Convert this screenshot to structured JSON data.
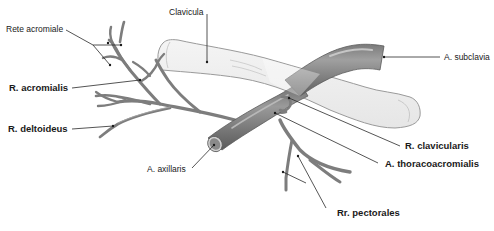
{
  "figure": {
    "colors": {
      "artery": "#7d7d7d",
      "artery_dark": "#5f5f5f",
      "artery_highlight": "#a9a9a9",
      "bone_fill": "#efefef",
      "bone_outline": "#9a9a9a",
      "label_text": "#1a1a1a",
      "background": "#ffffff"
    },
    "labels": {
      "clavicula": "Clavicula",
      "rete_acromiale": "Rete acromiale",
      "r_acromialis": "R. acromialis",
      "r_deltoideus": "R. deltoideus",
      "a_axillaris": "A. axillaris",
      "a_subclavia": "A. subclavia",
      "r_clavicularis": "R. clavicularis",
      "a_thoracoacromialis": "A. thoracoacromialis",
      "rr_pectorales": "Rr. pectorales"
    }
  }
}
